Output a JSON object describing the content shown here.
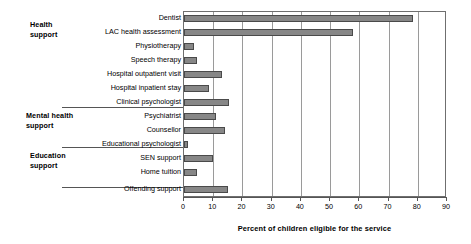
{
  "chart_data": {
    "type": "bar",
    "orientation": "horizontal",
    "title": "",
    "xlabel": "Percent of children eligible for the service",
    "ylabel": "",
    "xlim": [
      0,
      90
    ],
    "xticks": [
      0,
      10,
      20,
      30,
      40,
      50,
      60,
      70,
      80,
      90
    ],
    "grid": true,
    "legend": null,
    "bar_color": "#878787",
    "bar_edge_color": "#4a4a4a",
    "categories": [
      "Dentist",
      "LAC health assessment",
      "Physiotherapy",
      "Speech therapy",
      "Hospital outpatient visit",
      "Hospital inpatient stay",
      "Clinical psychologist",
      "Psychiatrist",
      "Counsellor",
      "Educational psychologist",
      "SEN support",
      "Home tuition",
      "Offending support"
    ],
    "values": [
      78.5,
      58,
      3.5,
      4.5,
      13,
      8.5,
      15.5,
      11,
      14,
      1.5,
      10,
      4.5,
      15
    ],
    "groups": [
      {
        "label": "Health\nsupport",
        "categories": [
          "Dentist",
          "LAC health assessment",
          "Physiotherapy",
          "Speech therapy",
          "Hospital outpatient visit",
          "Hospital inpatient stay"
        ]
      },
      {
        "label": "Mental health\nsupport",
        "categories": [
          "Clinical psychologist",
          "Psychiatrist",
          "Counsellor"
        ]
      },
      {
        "label": "Education\nsupport",
        "categories": [
          "Educational psychologist",
          "SEN support",
          "Home tuition"
        ]
      },
      {
        "label": "",
        "categories": [
          "Offending support"
        ]
      }
    ]
  }
}
